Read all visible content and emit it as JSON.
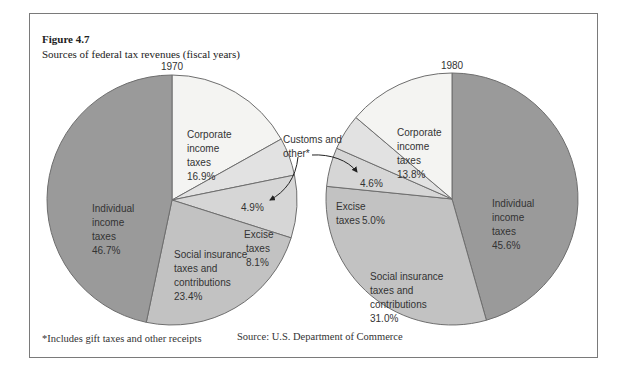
{
  "figure": {
    "label": "Figure 4.7",
    "title": "Sources of federal tax revenues (fiscal years)",
    "footnote": "*Includes gift taxes and other receipts",
    "source": "Source: U.S. Department of Commerce",
    "callout": "Customs and other*"
  },
  "chart_data": [
    {
      "type": "pie",
      "title": "1970",
      "categories": [
        "Individual income taxes",
        "Corporate income taxes",
        "Customs and other*",
        "Excise taxes",
        "Social insurance taxes and contributions"
      ],
      "values": [
        46.7,
        16.9,
        4.9,
        8.1,
        23.4
      ],
      "labels": [
        "46.7%",
        "16.9%",
        "4.9%",
        "8.1%",
        "23.4%"
      ]
    },
    {
      "type": "pie",
      "title": "1980",
      "categories": [
        "Individual income taxes",
        "Corporate income taxes",
        "Customs and other*",
        "Excise taxes",
        "Social insurance taxes and contributions"
      ],
      "values": [
        45.6,
        13.8,
        4.6,
        5.0,
        31.0
      ],
      "labels": [
        "45.6%",
        "13.8%",
        "4.6%",
        "5.0%",
        "31.0%"
      ]
    }
  ],
  "colors": {
    "individual": "#9a9a9a",
    "corporate": "#f4f4f2",
    "customs": "#e2e2e2",
    "excise": "#d6d6d6",
    "social": "#c2c2c2",
    "outline": "#6e6e6e"
  }
}
